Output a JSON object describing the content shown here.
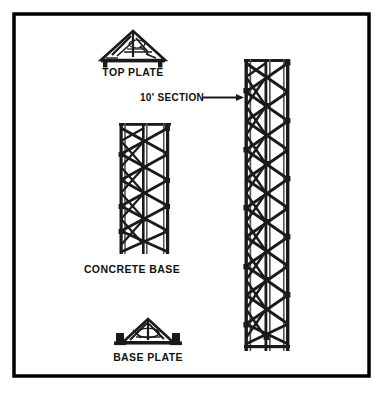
{
  "page": {
    "background_color": "#ffffff",
    "border_color": "#000000",
    "line_color": "#1a1a1a",
    "width": 384,
    "height": 395
  },
  "labels": {
    "top_plate": "TOP PLATE",
    "concrete_base": "CONCRETE BASE",
    "base_plate": "BASE PLATE",
    "section_callout": "10' SECTION"
  },
  "components": [
    {
      "id": "top-plate",
      "name": "top-plate-icon",
      "label": "TOP PLATE",
      "shape": "peaked-triangular-plate-with-feet",
      "x": 100,
      "y": 30,
      "width": 66,
      "height": 36
    },
    {
      "id": "section-callout",
      "name": "section-callout",
      "label": "10' SECTION",
      "shape": "text-with-arrow",
      "arrow_direction": "right",
      "x": 140,
      "y": 92,
      "width": 105,
      "height": 14
    },
    {
      "id": "concrete-base-tower",
      "name": "concrete-base-tower",
      "label": "CONCRETE BASE",
      "shape": "three-leg-lattice-tower",
      "legs": 3,
      "bays": 5,
      "x": 118,
      "y": 122,
      "width": 54,
      "height": 133
    },
    {
      "id": "base-plate",
      "name": "base-plate-icon",
      "label": "BASE PLATE",
      "shape": "triangular-base-plate-with-feet",
      "x": 116,
      "y": 318,
      "width": 64,
      "height": 30
    },
    {
      "id": "section-tower",
      "name": "ten-foot-section-tower",
      "label": "10' SECTION",
      "shape": "three-leg-lattice-tower",
      "legs": 3,
      "bays": 10,
      "x": 243,
      "y": 58,
      "width": 48,
      "height": 294
    }
  ],
  "geometry": {
    "border": {
      "x": 12,
      "y": 12,
      "width": 359,
      "height": 366,
      "stroke_width": 4
    },
    "concrete_base_tower": {
      "left": 120,
      "right": 170,
      "mid": 145,
      "top": 124,
      "bottom": 253,
      "bays": 5
    },
    "section_tower": {
      "left": 245,
      "right": 289,
      "mid": 267,
      "top": 60,
      "bottom": 350,
      "bays": 10
    },
    "callout_arrow": {
      "x1": 228,
      "x2": 244,
      "y": 97
    }
  },
  "label_positions": {
    "top_plate": {
      "x": 133,
      "y": 73
    },
    "section": {
      "x": 183,
      "y": 100
    },
    "concrete_base": {
      "x": 132,
      "y": 270
    },
    "base_plate": {
      "x": 147,
      "y": 358
    }
  }
}
